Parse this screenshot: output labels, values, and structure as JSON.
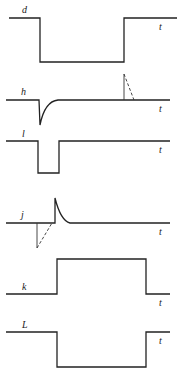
{
  "diagram": {
    "type": "timing-waveforms",
    "axis_label": "t",
    "signals": [
      {
        "name": "d",
        "label": "d",
        "shape": "high-low-high pulse"
      },
      {
        "name": "h",
        "label": "h",
        "shape": "negative spike with exponential recovery; dashed positive spike later"
      },
      {
        "name": "l",
        "label": "l",
        "shape": "short negative pulse"
      },
      {
        "name": "j",
        "label": "j",
        "shape": "dashed negative spike followed by positive spike with decay"
      },
      {
        "name": "k",
        "label": "k",
        "shape": "low-high-low pulse"
      },
      {
        "name": "L",
        "label": "L",
        "shape": "high-low-high pulse"
      }
    ],
    "colors": {
      "line": "#222222",
      "background": "#ffffff"
    }
  }
}
